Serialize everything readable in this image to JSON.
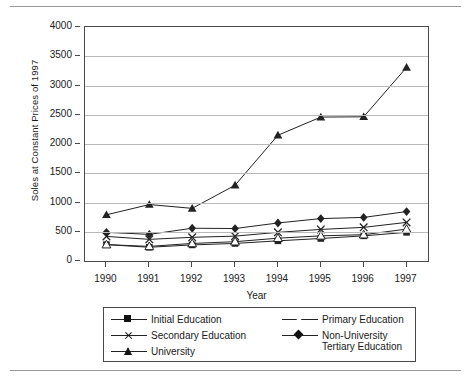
{
  "chart_data": {
    "type": "line",
    "title": "",
    "xlabel": "Year",
    "ylabel": "Soles at Constant Prices of 1997",
    "x": [
      1990,
      1991,
      1992,
      1993,
      1994,
      1995,
      1996,
      1997
    ],
    "categories": [
      "1990",
      "1991",
      "1992",
      "1993",
      "1994",
      "1995",
      "1996",
      "1997"
    ],
    "ylim": [
      0,
      4000
    ],
    "yticks": [
      0,
      500,
      1000,
      1500,
      2000,
      2500,
      3000,
      3500,
      4000
    ],
    "ytick_labels": [
      "0",
      "500",
      "1000",
      "1500",
      "2000",
      "2500",
      "3000",
      "3500",
      "4000"
    ],
    "grid": "horizontal",
    "legend_position": "below",
    "series": [
      {
        "name": "Initial Education",
        "marker": "filled-square",
        "values": [
          280,
          235,
          275,
          300,
          345,
          385,
          430,
          490
        ]
      },
      {
        "name": "Primary Education",
        "marker": "open-triangle",
        "values": [
          280,
          250,
          300,
          330,
          390,
          430,
          450,
          545
        ]
      },
      {
        "name": "Secondary Education",
        "marker": "cross",
        "values": [
          420,
          370,
          405,
          425,
          490,
          540,
          575,
          660
        ]
      },
      {
        "name": "Non-University Tertiary Education",
        "marker": "filled-diamond",
        "values": [
          490,
          455,
          560,
          555,
          650,
          725,
          745,
          845
        ]
      },
      {
        "name": "University",
        "marker": "filled-triangle",
        "values": [
          790,
          965,
          900,
          1295,
          2150,
          2460,
          2465,
          3310
        ]
      }
    ]
  },
  "legend": {
    "left_column": [
      {
        "label": "Initial Education",
        "marker": "filled-square"
      },
      {
        "label": "Secondary Education",
        "marker": "cross"
      },
      {
        "label": "University",
        "marker": "filled-triangle"
      }
    ],
    "right_column": [
      {
        "label": "Primary Education",
        "marker": "open-triangle"
      },
      {
        "label": "Non-University\nTertiary Education",
        "marker": "filled-diamond"
      }
    ]
  },
  "colors": {
    "line": "#222222",
    "axis": "#4a4a4a",
    "grid": "#b9b9b9",
    "background": "#ffffff",
    "rule": "#9a9a9a"
  }
}
